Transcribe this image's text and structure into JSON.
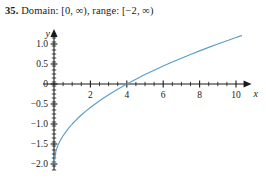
{
  "answer": {
    "number": "35.",
    "text": "Domain: [0, ∞), range: [−2, ∞)"
  },
  "chart_data": {
    "type": "line",
    "title": "",
    "xlabel": "x",
    "ylabel": "y",
    "xlim": [
      -0.6,
      10.8
    ],
    "ylim": [
      -2.15,
      1.35
    ],
    "grid": false,
    "legend": null,
    "curve_color": "#5a9ec7",
    "axis_color": "#1a1a1a",
    "function": "y = sqrt(x) - 2",
    "x_ticks_major": [
      "2",
      "4",
      "6",
      "8",
      "10"
    ],
    "x_tick_values": [
      2,
      4,
      6,
      8,
      10
    ],
    "x_minor_step": 0.5,
    "y_ticks_major": [
      "1.0",
      "0.5",
      "0",
      "−0.5",
      "−1.0",
      "−1.5",
      "−2.0"
    ],
    "y_tick_values": [
      1.0,
      0.5,
      0,
      -0.5,
      -1.0,
      -1.5,
      -2.0
    ],
    "y_minor_step": 0.1,
    "x_intercept": 4,
    "y_intercept": -2,
    "series": [
      {
        "name": "y = sqrt(x) - 2",
        "x": [
          0,
          0.1,
          0.2,
          0.3,
          0.4,
          0.5,
          0.75,
          1,
          1.25,
          1.5,
          1.75,
          2,
          2.5,
          3,
          3.5,
          4,
          4.5,
          5,
          5.5,
          6,
          6.5,
          7,
          7.5,
          8,
          8.5,
          9,
          9.5,
          10,
          10.3
        ],
        "y": [
          -2,
          -1.684,
          -1.553,
          -1.452,
          -1.368,
          -1.293,
          -1.134,
          -1,
          -0.882,
          -0.775,
          -0.677,
          -0.586,
          -0.419,
          -0.268,
          -0.129,
          0,
          0.121,
          0.236,
          0.345,
          0.449,
          0.55,
          0.646,
          0.739,
          0.828,
          0.915,
          1,
          1.082,
          1.162,
          1.209
        ]
      }
    ]
  }
}
